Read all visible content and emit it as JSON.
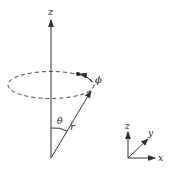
{
  "diagram": {
    "labels": {
      "z_main": "z",
      "phi": "ϕ",
      "theta": "θ",
      "r": "r",
      "z_small": "z",
      "y_small": "y",
      "x_small": "x"
    },
    "colors": {
      "stroke": "#333333",
      "background": "#ffffff"
    }
  }
}
